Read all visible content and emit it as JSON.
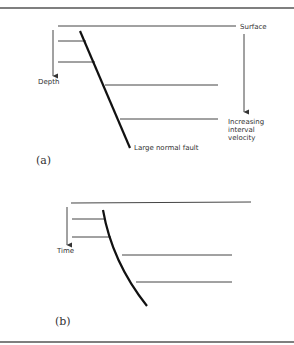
{
  "figure": {
    "panel_a": {
      "label": "(a)",
      "surface_label": "Surface",
      "axis_label": "Depth",
      "fault_label": "Large normal fault",
      "velocity_label_lines": [
        "Increasing",
        "interval",
        "velocity"
      ]
    },
    "panel_b": {
      "label": "(b)",
      "axis_label": "Time"
    }
  }
}
